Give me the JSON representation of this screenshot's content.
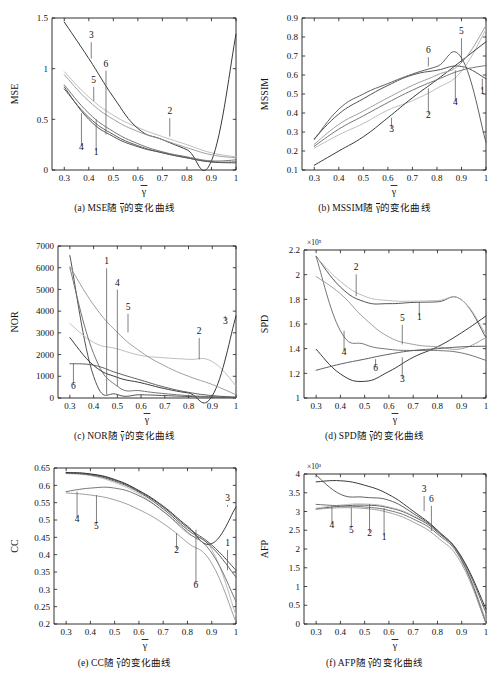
{
  "figure": {
    "title": "",
    "xvar": "γ",
    "xvar_overbar": true,
    "panels": [
      "a",
      "b",
      "c",
      "d",
      "e",
      "f"
    ]
  },
  "captions": {
    "a": {
      "prefix": "(a) ",
      "metric": "MSE",
      "mid": "随 ",
      "var": "γ",
      "suffix": "的变化曲线"
    },
    "b": {
      "prefix": "(b) ",
      "metric": "MSSIM",
      "mid": "随 ",
      "var": "γ",
      "suffix": "的变化曲线"
    },
    "c": {
      "prefix": "(c) ",
      "metric": "NOR",
      "mid": "随 ",
      "var": "γ",
      "suffix": "的变化曲线"
    },
    "d": {
      "prefix": "(d) ",
      "metric": "SPD",
      "mid": "随 ",
      "var": "γ",
      "suffix": "的变化曲线"
    },
    "e": {
      "prefix": "(e) ",
      "metric": "CC",
      "mid": "随 ",
      "var": "γ",
      "suffix": "的变化曲线"
    },
    "f": {
      "prefix": "(f) ",
      "metric": "AFP",
      "mid": "随 ",
      "var": "γ",
      "suffix": "的变化曲线"
    }
  },
  "colors": {
    "c1": "#4a4a4a",
    "c2": "#b9b9b9",
    "c3": "#2f2f2f",
    "c4": "#6e6e6e",
    "c5": "#9a9a9a",
    "c6": "#575757",
    "axis": "#1a1a1a",
    "leader": "#555555"
  },
  "chart_data": [
    {
      "id": "a",
      "type": "line",
      "title": "(a) MSE随γ的变化曲线",
      "xlabel": "γ",
      "ylabel": "MSE",
      "xlim": [
        0.25,
        1.0
      ],
      "ylim": [
        0,
        1.5
      ],
      "xticks": [
        0.3,
        0.4,
        0.5,
        0.6,
        0.7,
        0.8,
        0.9,
        1
      ],
      "xticklabels": [
        "0.3",
        "0.4",
        "0.5",
        "0.6",
        "0.7",
        "0.8",
        "0.9",
        "1"
      ],
      "yticks": [
        0,
        0.5,
        1,
        1.5
      ],
      "yticklabels": [
        "0",
        "0.5",
        "1",
        "1.5"
      ],
      "y_exponent": "",
      "grid": false,
      "legend": "inline-leader-labels",
      "x": [
        0.3,
        0.4,
        0.5,
        0.6,
        0.7,
        0.8,
        0.9,
        1.0
      ],
      "series": [
        {
          "name": "1",
          "values": [
            0.82,
            0.5,
            0.33,
            0.23,
            0.17,
            0.12,
            0.08,
            0.07
          ]
        },
        {
          "name": "2",
          "values": [
            0.97,
            0.72,
            0.54,
            0.42,
            0.33,
            0.25,
            0.17,
            0.13
          ]
        },
        {
          "name": "3",
          "values": [
            1.46,
            1.1,
            0.72,
            0.41,
            0.3,
            0.2,
            0.09,
            1.34
          ]
        },
        {
          "name": "4",
          "values": [
            0.84,
            0.56,
            0.38,
            0.26,
            0.18,
            0.13,
            0.09,
            0.1
          ]
        },
        {
          "name": "5",
          "values": [
            0.94,
            0.68,
            0.5,
            0.38,
            0.3,
            0.22,
            0.15,
            0.12
          ]
        },
        {
          "name": "6",
          "values": [
            0.8,
            0.52,
            0.35,
            0.24,
            0.17,
            0.12,
            0.08,
            0.08
          ]
        }
      ],
      "annotations": [
        {
          "label": "3",
          "x": 0.41,
          "y": 1.3
        },
        {
          "label": "6",
          "x": 0.47,
          "y": 1.02
        },
        {
          "label": "5",
          "x": 0.42,
          "y": 0.86
        },
        {
          "label": "4",
          "x": 0.37,
          "y": 0.2
        },
        {
          "label": "1",
          "x": 0.43,
          "y": 0.15
        },
        {
          "label": "2",
          "x": 0.73,
          "y": 0.55
        }
      ]
    },
    {
      "id": "b",
      "type": "line",
      "title": "(b) MSSIM随γ的变化曲线",
      "xlabel": "γ",
      "ylabel": "MSSIM",
      "xlim": [
        0.25,
        1.0
      ],
      "ylim": [
        0.1,
        0.9
      ],
      "xticks": [
        0.3,
        0.4,
        0.5,
        0.6,
        0.7,
        0.8,
        0.9,
        1
      ],
      "xticklabels": [
        "0.3",
        "0.4",
        "0.5",
        "0.6",
        "0.7",
        "0.8",
        "0.9",
        "1"
      ],
      "yticks": [
        0.1,
        0.2,
        0.3,
        0.4,
        0.5,
        0.6,
        0.7,
        0.8,
        0.9
      ],
      "yticklabels": [
        "0.1",
        "0.2",
        "0.3",
        "0.4",
        "0.5",
        "0.6",
        "0.7",
        "0.8",
        "0.9"
      ],
      "y_exponent": "",
      "grid": false,
      "legend": "inline-leader-labels",
      "x": [
        0.3,
        0.4,
        0.5,
        0.6,
        0.7,
        0.8,
        0.9,
        1.0
      ],
      "series": [
        {
          "name": "1",
          "values": [
            0.265,
            0.395,
            0.475,
            0.545,
            0.6,
            0.625,
            0.645,
            0.58
          ]
        },
        {
          "name": "2",
          "values": [
            0.215,
            0.285,
            0.345,
            0.415,
            0.465,
            0.53,
            0.62,
            0.84
          ]
        },
        {
          "name": "3",
          "values": [
            0.125,
            0.2,
            0.275,
            0.375,
            0.48,
            0.575,
            0.675,
            0.775
          ]
        },
        {
          "name": "4",
          "values": [
            0.225,
            0.315,
            0.385,
            0.455,
            0.52,
            0.575,
            0.625,
            0.65
          ]
        },
        {
          "name": "5",
          "values": [
            0.235,
            0.34,
            0.41,
            0.48,
            0.545,
            0.6,
            0.665,
            0.86
          ]
        },
        {
          "name": "6",
          "values": [
            0.26,
            0.42,
            0.5,
            0.555,
            0.605,
            0.645,
            0.69,
            0.245
          ]
        }
      ],
      "annotations": [
        {
          "label": "5",
          "x": 0.9,
          "y": 0.815
        },
        {
          "label": "6",
          "x": 0.765,
          "y": 0.715
        },
        {
          "label": "1",
          "x": 0.985,
          "y": 0.5
        },
        {
          "label": "4",
          "x": 0.875,
          "y": 0.44
        },
        {
          "label": "2",
          "x": 0.765,
          "y": 0.375
        },
        {
          "label": "3",
          "x": 0.615,
          "y": 0.3
        }
      ]
    },
    {
      "id": "c",
      "type": "line",
      "title": "(c) NOR随γ的变化曲线",
      "xlabel": "γ",
      "ylabel": "NOR",
      "xlim": [
        0.25,
        1.0
      ],
      "ylim": [
        0,
        7000
      ],
      "xticks": [
        0.3,
        0.4,
        0.5,
        0.6,
        0.7,
        0.8,
        0.9,
        1
      ],
      "xticklabels": [
        "0.3",
        "0.4",
        "0.5",
        "0.6",
        "0.7",
        "0.8",
        "0.9",
        "1"
      ],
      "yticks": [
        0,
        1000,
        2000,
        3000,
        4000,
        5000,
        6000,
        7000
      ],
      "yticklabels": [
        "0",
        "1000",
        "2000",
        "3000",
        "4000",
        "5000",
        "6000",
        "7000"
      ],
      "y_exponent": "",
      "grid": false,
      "legend": "inline-leader-labels",
      "x": [
        0.3,
        0.4,
        0.5,
        0.6,
        0.7,
        0.8,
        0.9,
        1.0
      ],
      "series": [
        {
          "name": "1",
          "values": [
            6560,
            1000,
            160,
            150,
            110,
            70,
            40,
            20
          ]
        },
        {
          "name": "2",
          "values": [
            3430,
            2560,
            2260,
            1960,
            1850,
            1780,
            1680,
            560
          ]
        },
        {
          "name": "3",
          "values": [
            2780,
            1500,
            950,
            700,
            430,
            230,
            100,
            3780
          ]
        },
        {
          "name": "4",
          "values": [
            5990,
            2050,
            540,
            330,
            200,
            110,
            60,
            30
          ]
        },
        {
          "name": "5",
          "values": [
            6060,
            4290,
            3020,
            2120,
            1480,
            1000,
            620,
            150
          ]
        },
        {
          "name": "6",
          "values": [
            1580,
            1510,
            1150,
            820,
            500,
            260,
            110,
            40
          ]
        }
      ],
      "annotations": [
        {
          "label": "1",
          "x": 0.455,
          "y": 6160
        },
        {
          "label": "4",
          "x": 0.5,
          "y": 5180
        },
        {
          "label": "5",
          "x": 0.545,
          "y": 4060
        },
        {
          "label": "3",
          "x": 0.955,
          "y": 3400
        },
        {
          "label": "2",
          "x": 0.845,
          "y": 2950
        },
        {
          "label": "6",
          "x": 0.315,
          "y": 430
        }
      ]
    },
    {
      "id": "d",
      "type": "line",
      "title": "(d) SPD随γ的变化曲线",
      "xlabel": "γ",
      "ylabel": "SPD",
      "xlim": [
        0.25,
        1.0
      ],
      "ylim": [
        1.0,
        2.2
      ],
      "xticks": [
        0.3,
        0.4,
        0.5,
        0.6,
        0.7,
        0.8,
        0.9,
        1
      ],
      "xticklabels": [
        "0.3",
        "0.4",
        "0.5",
        "0.6",
        "0.7",
        "0.8",
        "0.9",
        "1"
      ],
      "yticks": [
        1,
        1.2,
        1.4,
        1.6,
        1.8,
        2,
        2.2
      ],
      "yticklabels": [
        "1",
        "1.2",
        "1.4",
        "1.6",
        "1.8",
        "2",
        "2.2"
      ],
      "y_exponent": "×10⁵",
      "grid": false,
      "legend": "inline-leader-labels",
      "x": [
        0.3,
        0.4,
        0.5,
        0.6,
        0.7,
        0.8,
        0.9,
        1.0
      ],
      "series": [
        {
          "name": "1",
          "values": [
            2.15,
            1.9,
            1.78,
            1.765,
            1.775,
            1.78,
            1.795,
            1.49
          ]
        },
        {
          "name": "2",
          "values": [
            2.145,
            1.945,
            1.825,
            1.79,
            1.785,
            1.79,
            1.795,
            1.515
          ]
        },
        {
          "name": "3",
          "values": [
            1.395,
            1.195,
            1.135,
            1.215,
            1.33,
            1.415,
            1.53,
            1.665
          ]
        },
        {
          "name": "4",
          "values": [
            2.145,
            1.545,
            1.435,
            1.395,
            1.385,
            1.385,
            1.365,
            1.305
          ]
        },
        {
          "name": "5",
          "values": [
            1.985,
            1.845,
            1.645,
            1.495,
            1.435,
            1.415,
            1.4,
            1.49
          ]
        },
        {
          "name": "6",
          "values": [
            1.225,
            1.275,
            1.315,
            1.355,
            1.385,
            1.4,
            1.415,
            1.42
          ]
        }
      ],
      "annotations": [
        {
          "label": "2",
          "x": 0.465,
          "y": 2.035
        },
        {
          "label": "5",
          "x": 0.655,
          "y": 1.625
        },
        {
          "label": "1",
          "x": 0.725,
          "y": 1.635
        },
        {
          "label": "4",
          "x": 0.415,
          "y": 1.35
        },
        {
          "label": "6",
          "x": 0.545,
          "y": 1.215
        },
        {
          "label": "3",
          "x": 0.655,
          "y": 1.13
        }
      ]
    },
    {
      "id": "e",
      "type": "line",
      "title": "(e) CC随γ的变化曲线",
      "xlabel": "γ",
      "ylabel": "CC",
      "xlim": [
        0.25,
        1.0
      ],
      "ylim": [
        0.2,
        0.65
      ],
      "xticks": [
        0.3,
        0.4,
        0.5,
        0.6,
        0.7,
        0.8,
        0.9,
        1
      ],
      "xticklabels": [
        "0.3",
        "0.4",
        "0.5",
        "0.6",
        "0.7",
        "0.8",
        "0.9",
        "1"
      ],
      "yticks": [
        0.2,
        0.25,
        0.3,
        0.35,
        0.4,
        0.45,
        0.5,
        0.55,
        0.6,
        0.65
      ],
      "yticklabels": [
        "0.2",
        "0.25",
        "0.3",
        "0.35",
        "0.4",
        "0.45",
        "0.5",
        "0.55",
        "0.6",
        "0.65"
      ],
      "y_exponent": "",
      "grid": false,
      "legend": "inline-leader-labels",
      "x": [
        0.3,
        0.4,
        0.5,
        0.6,
        0.7,
        0.8,
        0.9,
        1.0
      ],
      "series": [
        {
          "name": "1",
          "values": [
            0.636,
            0.632,
            0.615,
            0.583,
            0.537,
            0.478,
            0.428,
            0.355
          ]
        },
        {
          "name": "2",
          "values": [
            0.634,
            0.628,
            0.608,
            0.575,
            0.525,
            0.462,
            0.415,
            0.225
          ]
        },
        {
          "name": "3",
          "values": [
            0.637,
            0.633,
            0.617,
            0.585,
            0.54,
            0.482,
            0.432,
            0.538
          ]
        },
        {
          "name": "4",
          "values": [
            0.582,
            0.592,
            0.592,
            0.57,
            0.525,
            0.465,
            0.405,
            0.265
          ]
        },
        {
          "name": "5",
          "values": [
            0.578,
            0.572,
            0.558,
            0.53,
            0.49,
            0.435,
            0.375,
            0.205
          ]
        },
        {
          "name": "6",
          "values": [
            0.635,
            0.63,
            0.612,
            0.58,
            0.532,
            0.472,
            0.422,
            0.335
          ]
        }
      ],
      "annotations": [
        {
          "label": "3",
          "x": 0.965,
          "y": 0.555
        },
        {
          "label": "4",
          "x": 0.345,
          "y": 0.495
        },
        {
          "label": "5",
          "x": 0.425,
          "y": 0.475
        },
        {
          "label": "2",
          "x": 0.755,
          "y": 0.405
        },
        {
          "label": "1",
          "x": 0.965,
          "y": 0.425
        },
        {
          "label": "6",
          "x": 0.835,
          "y": 0.305
        }
      ]
    },
    {
      "id": "f",
      "type": "line",
      "title": "(f) AFP随γ的变化曲线",
      "xlabel": "γ",
      "ylabel": "AFP",
      "xlim": [
        0.25,
        1.0
      ],
      "ylim": [
        0,
        4
      ],
      "xticks": [
        0.3,
        0.4,
        0.5,
        0.6,
        0.7,
        0.8,
        0.9,
        1
      ],
      "xticklabels": [
        "0.3",
        "0.4",
        "0.5",
        "0.6",
        "0.7",
        "0.8",
        "0.9",
        "1"
      ],
      "yticks": [
        0,
        0.5,
        1,
        1.5,
        2,
        2.5,
        3,
        3.5,
        4
      ],
      "yticklabels": [
        "0",
        "0.5",
        "1",
        "1.5",
        "2",
        "2.5",
        "3",
        "3.5",
        "4"
      ],
      "y_exponent": "×10³",
      "grid": false,
      "legend": "inline-leader-labels",
      "x": [
        0.3,
        0.4,
        0.5,
        0.6,
        0.7,
        0.8,
        0.9,
        1.0
      ],
      "series": [
        {
          "name": "1",
          "values": [
            3.07,
            3.14,
            3.17,
            3.1,
            2.87,
            2.45,
            1.72,
            0.04
          ]
        },
        {
          "name": "2",
          "values": [
            3.09,
            3.17,
            3.2,
            3.12,
            2.89,
            2.47,
            1.75,
            0.1
          ]
        },
        {
          "name": "3",
          "values": [
            3.79,
            3.82,
            3.7,
            3.45,
            3.01,
            2.5,
            1.78,
            0.4
          ]
        },
        {
          "name": "4",
          "values": [
            3.19,
            3.15,
            3.12,
            3.03,
            2.8,
            2.4,
            1.68,
            0.02
          ]
        },
        {
          "name": "5",
          "values": [
            3.06,
            3.1,
            3.08,
            2.97,
            2.72,
            2.31,
            1.6,
            0.01
          ]
        },
        {
          "name": "6",
          "values": [
            3.97,
            3.46,
            3.38,
            3.3,
            2.95,
            2.48,
            1.76,
            0.3
          ]
        }
      ],
      "annotations": [
        {
          "label": "3",
          "x": 0.745,
          "y": 3.52
        },
        {
          "label": "6",
          "x": 0.775,
          "y": 3.26
        },
        {
          "label": "4",
          "x": 0.365,
          "y": 2.56
        },
        {
          "label": "5",
          "x": 0.445,
          "y": 2.44
        },
        {
          "label": "2",
          "x": 0.52,
          "y": 2.34
        },
        {
          "label": "1",
          "x": 0.58,
          "y": 2.25
        }
      ]
    }
  ]
}
